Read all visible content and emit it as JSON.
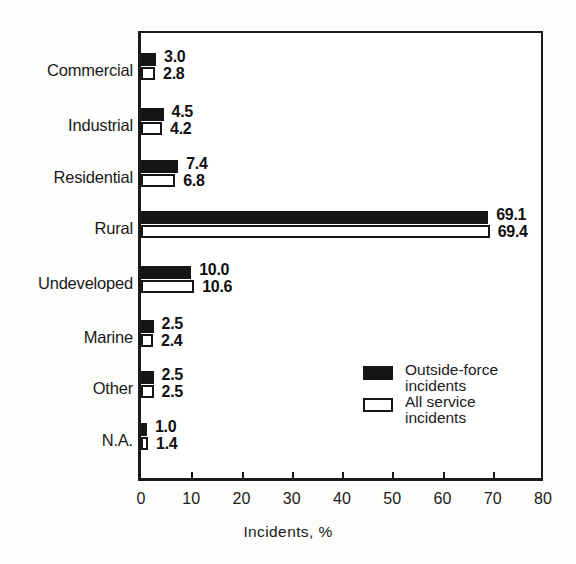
{
  "chart_data": {
    "type": "bar",
    "orientation": "horizontal",
    "title": "",
    "xlabel": "Incidents, %",
    "ylabel": "",
    "xlim": [
      0,
      80
    ],
    "xticks": [
      0,
      10,
      20,
      30,
      40,
      50,
      60,
      70,
      80
    ],
    "xtick_labels": [
      "0",
      "10",
      "20",
      "30",
      "40",
      "50",
      "60",
      "70",
      "80"
    ],
    "grid": false,
    "legend_position": "inside-lower-right",
    "categories": [
      "Commercial",
      "Industrial",
      "Residential",
      "Rural",
      "Undeveloped",
      "Marine",
      "Other",
      "N.A."
    ],
    "series": [
      {
        "name": "Outside-force incidents",
        "style": "filled-black",
        "values": [
          3.0,
          4.5,
          7.4,
          69.1,
          10.0,
          2.5,
          2.5,
          1.0
        ],
        "value_labels": [
          "3.0",
          "4.5",
          "7.4",
          "69.1",
          "10.0",
          "2.5",
          "2.5",
          "1.0"
        ]
      },
      {
        "name": "All service incidents",
        "style": "open-white",
        "values": [
          2.8,
          4.2,
          6.8,
          69.4,
          10.6,
          2.4,
          2.5,
          1.4
        ],
        "value_labels": [
          "2.8",
          "4.2",
          "6.8",
          "69.4",
          "10.6",
          "2.4",
          "2.5",
          "1.4"
        ]
      }
    ]
  },
  "legend": {
    "items": [
      {
        "label": "Outside-force\nincidents",
        "style": "dark"
      },
      {
        "label": "All service\nincidents",
        "style": "open"
      }
    ]
  },
  "colors": {
    "ink": "#151515",
    "background": "#fdfdfb",
    "plot_background": "#ffffff"
  }
}
